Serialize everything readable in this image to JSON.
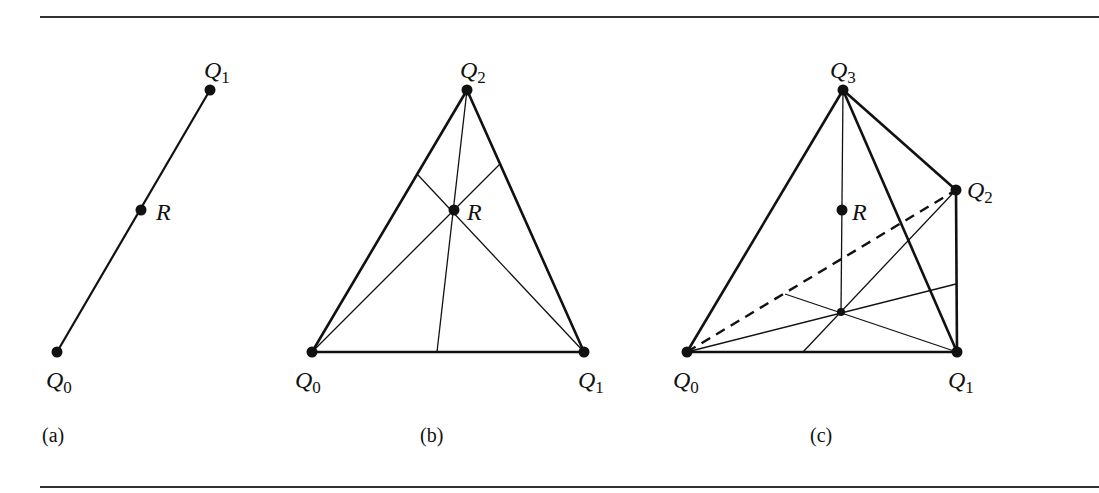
{
  "figure": {
    "panels": [
      {
        "caption": "(a)",
        "points": [
          {
            "name": "Q",
            "sub": "0",
            "x": 57,
            "y": 352
          },
          {
            "name": "Q",
            "sub": "1",
            "x": 210,
            "y": 90
          },
          {
            "name": "R",
            "sub": "",
            "x": 141,
            "y": 210
          }
        ]
      },
      {
        "caption": "(b)",
        "points": [
          {
            "name": "Q",
            "sub": "0",
            "x": 312,
            "y": 352
          },
          {
            "name": "Q",
            "sub": "1",
            "x": 584,
            "y": 352
          },
          {
            "name": "Q",
            "sub": "2",
            "x": 467,
            "y": 90
          },
          {
            "name": "R",
            "sub": "",
            "x": 454,
            "y": 210
          }
        ]
      },
      {
        "caption": "(c)",
        "points": [
          {
            "name": "Q",
            "sub": "0",
            "x": 687,
            "y": 352
          },
          {
            "name": "Q",
            "sub": "1",
            "x": 957,
            "y": 352
          },
          {
            "name": "Q",
            "sub": "2",
            "x": 956,
            "y": 190
          },
          {
            "name": "Q",
            "sub": "3",
            "x": 843,
            "y": 90
          },
          {
            "name": "R",
            "sub": "",
            "x": 842,
            "y": 210
          }
        ]
      }
    ],
    "labels": {
      "a_q0": "Q",
      "a_q0_sub": "0",
      "a_q1": "Q",
      "a_q1_sub": "1",
      "a_r": "R",
      "b_q0": "Q",
      "b_q0_sub": "0",
      "b_q1": "Q",
      "b_q1_sub": "1",
      "b_q2": "Q",
      "b_q2_sub": "2",
      "b_r": "R",
      "c_q0": "Q",
      "c_q0_sub": "0",
      "c_q1": "Q",
      "c_q1_sub": "1",
      "c_q2": "Q",
      "c_q2_sub": "2",
      "c_q3": "Q",
      "c_q3_sub": "3",
      "c_r": "R"
    },
    "captions": {
      "a": "(a)",
      "b": "(b)",
      "c": "(c)"
    },
    "colors": {
      "ink": "#111111",
      "background": "#ffffff"
    }
  }
}
